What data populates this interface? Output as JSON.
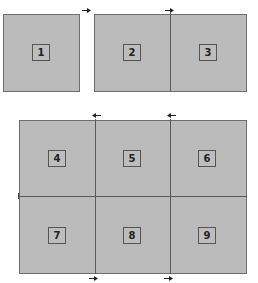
{
  "diagram": {
    "colors": {
      "fill": "#bbbbbb",
      "border": "#6e6e6e",
      "divider": "#5a5a5a",
      "label_border": "#555555",
      "text": "#222222"
    },
    "top_row": {
      "single_panel": {
        "cells": [
          {
            "label": "1"
          }
        ]
      },
      "split_panel": {
        "cells": [
          {
            "label": "2"
          },
          {
            "label": "3"
          }
        ]
      }
    },
    "grid": {
      "rows": 2,
      "cols": 3,
      "cells": [
        {
          "label": "4"
        },
        {
          "label": "5"
        },
        {
          "label": "6"
        },
        {
          "label": "7"
        },
        {
          "label": "8"
        },
        {
          "label": "9"
        }
      ]
    },
    "arrows": [
      {
        "position": "top-left of panel 2",
        "direction": "right"
      },
      {
        "position": "top of divider 2|3",
        "direction": "right"
      },
      {
        "position": "top of divider 4|5",
        "direction": "left"
      },
      {
        "position": "top of divider 5|6",
        "direction": "left"
      },
      {
        "position": "bottom of divider 7|8",
        "direction": "right"
      },
      {
        "position": "bottom of divider 8|9",
        "direction": "right"
      }
    ]
  }
}
